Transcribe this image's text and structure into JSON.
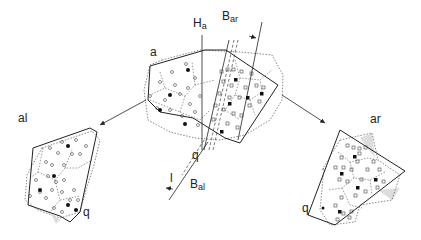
{
  "labels": {
    "a": "a",
    "H": "H",
    "H_sub": "a",
    "B_ar": "B",
    "B_ar_sub": "ar",
    "B_al": "B",
    "B_al_sub": "al",
    "l": "l",
    "q_center": "q",
    "al": "al",
    "ar": "ar",
    "q_left": "q",
    "q_right": "q"
  },
  "colors": {
    "stroke": "#222222",
    "dotted": "#555555",
    "shade": "#dddddd",
    "background": "#ffffff"
  }
}
